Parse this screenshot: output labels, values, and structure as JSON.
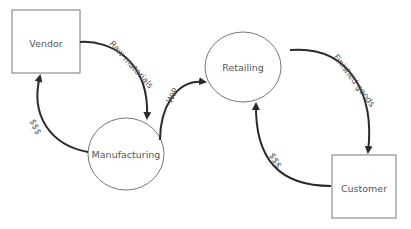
{
  "diagram": {
    "type": "flow-cycle",
    "nodes": [
      {
        "id": "vendor",
        "label": "Vendor",
        "shape": "rectangle"
      },
      {
        "id": "manufacturing",
        "label": "Manufacturing",
        "shape": "circle"
      },
      {
        "id": "retailing",
        "label": "Retailing",
        "shape": "circle"
      },
      {
        "id": "customer",
        "label": "Customer",
        "shape": "rectangle"
      }
    ],
    "edges": [
      {
        "from": "vendor",
        "to": "manufacturing",
        "label": "Raw materials"
      },
      {
        "from": "manufacturing",
        "to": "vendor",
        "label": "$$$"
      },
      {
        "from": "manufacturing",
        "to": "retailing",
        "label": "WIP"
      },
      {
        "from": "retailing",
        "to": "customer",
        "label": "Finished goods"
      },
      {
        "from": "customer",
        "to": "retailing",
        "label": "$$$"
      }
    ]
  },
  "colors": {
    "node_stroke": "#777777",
    "edge": "#2a2a2a",
    "text": "#555555",
    "background": "#ffffff"
  }
}
